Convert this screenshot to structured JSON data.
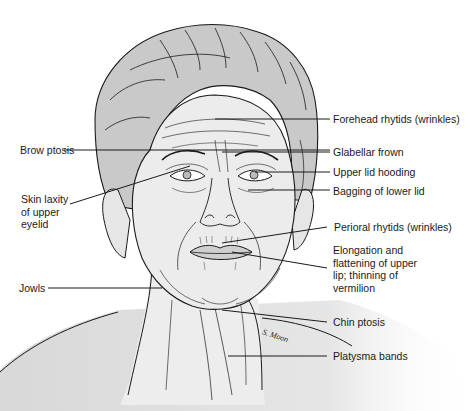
{
  "figure": {
    "signature": "S. Moon",
    "colors": {
      "line": "#1a1a1a",
      "hair": "#c8c8c8",
      "skin": "#ececec",
      "background": "#ffffff"
    }
  },
  "labels": {
    "left": [
      {
        "id": "brow-ptosis",
        "text": "Brow ptosis"
      },
      {
        "id": "skin-laxity",
        "lines": [
          "Skin laxity",
          "of upper",
          "eyelid"
        ]
      },
      {
        "id": "jowls",
        "text": "Jowls"
      }
    ],
    "right": [
      {
        "id": "forehead-rhytids",
        "text": "Forehead rhytids (wrinkles)"
      },
      {
        "id": "glabellar-frown",
        "text": "Glabellar frown"
      },
      {
        "id": "upper-lid-hooding",
        "text": "Upper lid hooding"
      },
      {
        "id": "bagging-lower-lid",
        "text": "Bagging of lower lid"
      },
      {
        "id": "perioral-rhytids",
        "text": "Perioral rhytids (wrinkles)"
      },
      {
        "id": "upper-lip",
        "lines": [
          "Elongation and",
          "flattening of upper",
          "lip; thinning of",
          "vermilion"
        ]
      },
      {
        "id": "chin-ptosis",
        "text": "Chin ptosis"
      },
      {
        "id": "platysma-bands",
        "text": "Platysma bands"
      }
    ]
  }
}
